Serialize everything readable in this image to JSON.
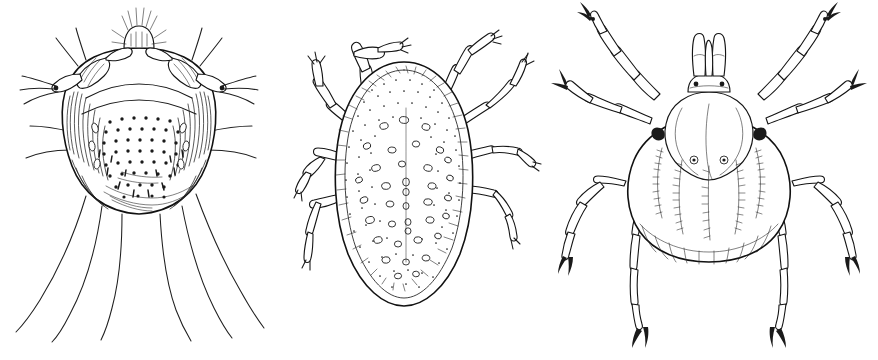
{
  "plate": {
    "title": "Plate of three acarine line drawings",
    "background_color": "#ffffff",
    "ink_color": "#1a1a1a",
    "style": "black and white scientific pen-and-ink line drawing",
    "width_px": 878,
    "height_px": 360,
    "figure_count": 3,
    "orientation": "three figures side by side, left to right"
  },
  "figures": [
    {
      "id": "sarcoptes",
      "position": "left",
      "label": "",
      "subject": "scabies mite, dorsal view",
      "body_shape": "rounded, nearly circular idiosoma",
      "texture": "dense stippled dots with short spine-like scales and fine cross hatching on the margins",
      "legs": 4,
      "leg_description": "two short stout anterior leg pairs with banded segments flanking the gnathosoma",
      "setae": "six long curving posterior setae trailing well below the body",
      "gnathosoma": "small bristled head capsule at top center",
      "bbox": {
        "x": 0,
        "y": 0,
        "width": 292,
        "height": 360
      }
    },
    {
      "id": "dermanyssus",
      "position": "center",
      "label": "",
      "subject": "poultry red mite, dorsal view",
      "body_shape": "broad oval idiosoma, widest below mid height",
      "texture": "fine stippling across the dorsum with scattered pale oval pits and a beaded, scalloped margin",
      "legs": 8,
      "leg_description": "eight long slender multi-segmented legs, front pairs raised above the body, each ending in a small claw",
      "setae": "none prominent",
      "gnathosoma": "hidden beneath the anterior margin",
      "bbox": {
        "x": 292,
        "y": 0,
        "width": 250,
        "height": 360
      }
    },
    {
      "id": "ixodid",
      "position": "right",
      "label": "",
      "subject": "hard tick, dorsal view",
      "body_shape": "shield-shaped scutum above a broad striated abdomen",
      "texture": "longitudinal grooves fringed with short hairs, a row of marginal festoons along the lower edge, and two small round spiracle-like openings",
      "legs": 8,
      "leg_description": "eight long segmented legs with rectangular podomeres, black coxal spots at the body attachment and dark claws at every tip",
      "setae": "short hairs along the body grooves",
      "gnathosoma": "prominent capitulum with paired palps and hypostome projecting at the top",
      "bbox": {
        "x": 542,
        "y": 0,
        "width": 336,
        "height": 360
      }
    }
  ],
  "colors": {
    "background": "#ffffff",
    "ink": "#1a1a1a",
    "shading": "#232323"
  }
}
